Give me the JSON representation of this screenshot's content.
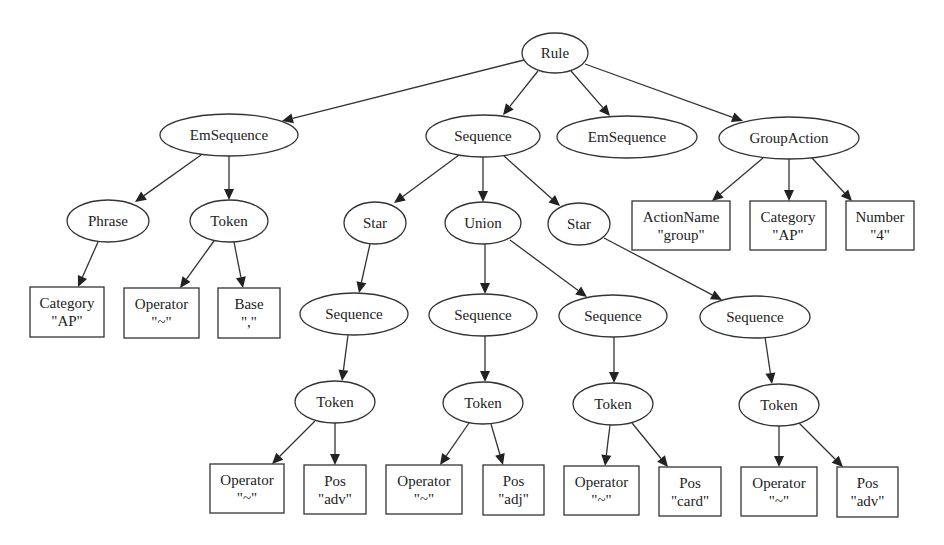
{
  "diagram": {
    "title": "",
    "nodes": [
      {
        "id": "rule",
        "shape": "ellipse",
        "cx": 555,
        "cy": 53,
        "rx": 33,
        "ry": 20,
        "lines": [
          "Rule"
        ]
      },
      {
        "id": "emseq1",
        "shape": "ellipse",
        "cx": 229,
        "cy": 135,
        "rx": 69,
        "ry": 21,
        "lines": [
          "EmSequence"
        ]
      },
      {
        "id": "seq_main",
        "shape": "ellipse",
        "cx": 483,
        "cy": 136,
        "rx": 57,
        "ry": 21,
        "lines": [
          "Sequence"
        ]
      },
      {
        "id": "emseq2",
        "shape": "ellipse",
        "cx": 627,
        "cy": 137,
        "rx": 70,
        "ry": 21,
        "lines": [
          "EmSequence"
        ]
      },
      {
        "id": "groupaction",
        "shape": "ellipse",
        "cx": 789,
        "cy": 138,
        "rx": 70,
        "ry": 21,
        "lines": [
          "GroupAction"
        ]
      },
      {
        "id": "phrase",
        "shape": "ellipse",
        "cx": 108,
        "cy": 221,
        "rx": 41,
        "ry": 21,
        "lines": [
          "Phrase"
        ]
      },
      {
        "id": "token_a",
        "shape": "ellipse",
        "cx": 229,
        "cy": 221,
        "rx": 39,
        "ry": 21,
        "lines": [
          "Token"
        ]
      },
      {
        "id": "star1",
        "shape": "ellipse",
        "cx": 375,
        "cy": 223,
        "rx": 31,
        "ry": 21,
        "lines": [
          "Star"
        ]
      },
      {
        "id": "union",
        "shape": "ellipse",
        "cx": 483,
        "cy": 223,
        "rx": 38,
        "ry": 21,
        "lines": [
          "Union"
        ]
      },
      {
        "id": "star2",
        "shape": "ellipse",
        "cx": 579,
        "cy": 224,
        "rx": 31,
        "ry": 21,
        "lines": [
          "Star"
        ]
      },
      {
        "id": "actionname",
        "shape": "rect",
        "x": 632,
        "y": 201,
        "w": 98,
        "h": 49,
        "lines": [
          "ActionName",
          "\"group\""
        ]
      },
      {
        "id": "category_ga",
        "shape": "rect",
        "x": 750,
        "y": 201,
        "w": 76,
        "h": 49,
        "lines": [
          "Category",
          "\"AP\""
        ]
      },
      {
        "id": "number",
        "shape": "rect",
        "x": 846,
        "y": 201,
        "w": 68,
        "h": 49,
        "lines": [
          "Number",
          "\"4\""
        ]
      },
      {
        "id": "category_p",
        "shape": "rect",
        "x": 30,
        "y": 287,
        "w": 74,
        "h": 50,
        "lines": [
          "Category",
          "\"AP\""
        ]
      },
      {
        "id": "operator_a",
        "shape": "rect",
        "x": 124,
        "y": 288,
        "w": 75,
        "h": 50,
        "lines": [
          "Operator",
          "\"~\""
        ]
      },
      {
        "id": "base",
        "shape": "rect",
        "x": 218,
        "y": 288,
        "w": 62,
        "h": 50,
        "lines": [
          "Base",
          "\",\""
        ]
      },
      {
        "id": "seq_s1",
        "shape": "ellipse",
        "cx": 354,
        "cy": 314,
        "rx": 54,
        "ry": 21,
        "lines": [
          "Sequence"
        ]
      },
      {
        "id": "seq_u1",
        "shape": "ellipse",
        "cx": 483,
        "cy": 315,
        "rx": 54,
        "ry": 21,
        "lines": [
          "Sequence"
        ]
      },
      {
        "id": "seq_u2",
        "shape": "ellipse",
        "cx": 613,
        "cy": 316,
        "rx": 54,
        "ry": 21,
        "lines": [
          "Sequence"
        ]
      },
      {
        "id": "seq_s2",
        "shape": "ellipse",
        "cx": 755,
        "cy": 317,
        "rx": 55,
        "ry": 21,
        "lines": [
          "Sequence"
        ]
      },
      {
        "id": "token_1",
        "shape": "ellipse",
        "cx": 335,
        "cy": 402,
        "rx": 40,
        "ry": 21,
        "lines": [
          "Token"
        ]
      },
      {
        "id": "token_2",
        "shape": "ellipse",
        "cx": 483,
        "cy": 403,
        "rx": 40,
        "ry": 21,
        "lines": [
          "Token"
        ]
      },
      {
        "id": "token_3",
        "shape": "ellipse",
        "cx": 613,
        "cy": 404,
        "rx": 40,
        "ry": 21,
        "lines": [
          "Token"
        ]
      },
      {
        "id": "token_4",
        "shape": "ellipse",
        "cx": 779,
        "cy": 405,
        "rx": 40,
        "ry": 21,
        "lines": [
          "Token"
        ]
      },
      {
        "id": "operator_1",
        "shape": "rect",
        "x": 210,
        "y": 464,
        "w": 74,
        "h": 49,
        "lines": [
          "Operator",
          "\"~\""
        ]
      },
      {
        "id": "pos_1",
        "shape": "rect",
        "x": 304,
        "y": 465,
        "w": 62,
        "h": 49,
        "lines": [
          "Pos",
          "\"adv\""
        ]
      },
      {
        "id": "operator_2",
        "shape": "rect",
        "x": 386,
        "y": 465,
        "w": 76,
        "h": 49,
        "lines": [
          "Operator",
          "\"~\""
        ]
      },
      {
        "id": "pos_2",
        "shape": "rect",
        "x": 483,
        "y": 465,
        "w": 61,
        "h": 50,
        "lines": [
          "Pos",
          "\"adj\""
        ]
      },
      {
        "id": "operator_3",
        "shape": "rect",
        "x": 564,
        "y": 466,
        "w": 75,
        "h": 49,
        "lines": [
          "Operator",
          "\"~\""
        ]
      },
      {
        "id": "pos_3",
        "shape": "rect",
        "x": 659,
        "y": 467,
        "w": 62,
        "h": 49,
        "lines": [
          "Pos",
          "\"card\""
        ]
      },
      {
        "id": "operator_4",
        "shape": "rect",
        "x": 741,
        "y": 467,
        "w": 76,
        "h": 49,
        "lines": [
          "Operator",
          "\"~\""
        ]
      },
      {
        "id": "pos_4",
        "shape": "rect",
        "x": 837,
        "y": 467,
        "w": 61,
        "h": 50,
        "lines": [
          "Pos",
          "\"adv\""
        ]
      }
    ],
    "edges": [
      {
        "from": "rule",
        "to": "emseq1",
        "x1": 524,
        "y1": 60,
        "x2": 282,
        "y2": 121
      },
      {
        "from": "rule",
        "to": "seq_main",
        "x1": 538,
        "y1": 71,
        "x2": 503,
        "y2": 115
      },
      {
        "from": "rule",
        "to": "emseq2",
        "x1": 571,
        "y1": 71,
        "x2": 610,
        "y2": 116
      },
      {
        "from": "rule",
        "to": "groupaction",
        "x1": 585,
        "y1": 64,
        "x2": 743,
        "y2": 121
      },
      {
        "from": "emseq1",
        "to": "phrase",
        "x1": 201,
        "y1": 155,
        "x2": 135,
        "y2": 202
      },
      {
        "from": "emseq1",
        "to": "token_a",
        "x1": 229,
        "y1": 156,
        "x2": 229,
        "y2": 200
      },
      {
        "from": "seq_main",
        "to": "star1",
        "x1": 459,
        "y1": 155,
        "x2": 394,
        "y2": 203
      },
      {
        "from": "seq_main",
        "to": "union",
        "x1": 483,
        "y1": 157,
        "x2": 483,
        "y2": 202
      },
      {
        "from": "seq_main",
        "to": "star2",
        "x1": 504,
        "y1": 156,
        "x2": 560,
        "y2": 206
      },
      {
        "from": "groupaction",
        "to": "actionname",
        "x1": 763,
        "y1": 158,
        "x2": 712,
        "y2": 201
      },
      {
        "from": "groupaction",
        "to": "category_ga",
        "x1": 789,
        "y1": 159,
        "x2": 789,
        "y2": 201
      },
      {
        "from": "groupaction",
        "to": "number",
        "x1": 812,
        "y1": 158,
        "x2": 852,
        "y2": 201
      },
      {
        "from": "phrase",
        "to": "category_p",
        "x1": 98,
        "y1": 242,
        "x2": 78,
        "y2": 287
      },
      {
        "from": "token_a",
        "to": "operator_a",
        "x1": 214,
        "y1": 241,
        "x2": 180,
        "y2": 288
      },
      {
        "from": "token_a",
        "to": "base",
        "x1": 234,
        "y1": 242,
        "x2": 243,
        "y2": 288
      },
      {
        "from": "star1",
        "to": "seq_s1",
        "x1": 370,
        "y1": 244,
        "x2": 359,
        "y2": 293
      },
      {
        "from": "union",
        "to": "seq_u1",
        "x1": 485,
        "y1": 244,
        "x2": 485,
        "y2": 294
      },
      {
        "from": "union",
        "to": "seq_u2",
        "x1": 510,
        "y1": 240,
        "x2": 587,
        "y2": 297
      },
      {
        "from": "star2",
        "to": "seq_s2",
        "x1": 604,
        "y1": 238,
        "x2": 722,
        "y2": 300
      },
      {
        "from": "seq_s1",
        "to": "token_1",
        "x1": 348,
        "y1": 335,
        "x2": 342,
        "y2": 381
      },
      {
        "from": "seq_u1",
        "to": "token_2",
        "x1": 485,
        "y1": 336,
        "x2": 485,
        "y2": 382
      },
      {
        "from": "seq_u2",
        "to": "token_3",
        "x1": 614,
        "y1": 337,
        "x2": 614,
        "y2": 383
      },
      {
        "from": "seq_s2",
        "to": "token_4",
        "x1": 765,
        "y1": 337,
        "x2": 772,
        "y2": 384
      },
      {
        "from": "token_1",
        "to": "operator_1",
        "x1": 315,
        "y1": 421,
        "x2": 272,
        "y2": 464
      },
      {
        "from": "token_1",
        "to": "pos_1",
        "x1": 335,
        "y1": 423,
        "x2": 335,
        "y2": 465
      },
      {
        "from": "token_2",
        "to": "operator_2",
        "x1": 469,
        "y1": 423,
        "x2": 440,
        "y2": 465
      },
      {
        "from": "token_2",
        "to": "pos_2",
        "x1": 491,
        "y1": 424,
        "x2": 503,
        "y2": 465
      },
      {
        "from": "token_3",
        "to": "operator_3",
        "x1": 610,
        "y1": 425,
        "x2": 605,
        "y2": 466
      },
      {
        "from": "token_3",
        "to": "pos_3",
        "x1": 632,
        "y1": 423,
        "x2": 668,
        "y2": 467
      },
      {
        "from": "token_4",
        "to": "operator_4",
        "x1": 779,
        "y1": 426,
        "x2": 779,
        "y2": 467
      },
      {
        "from": "token_4",
        "to": "pos_4",
        "x1": 799,
        "y1": 423,
        "x2": 843,
        "y2": 467
      }
    ]
  }
}
